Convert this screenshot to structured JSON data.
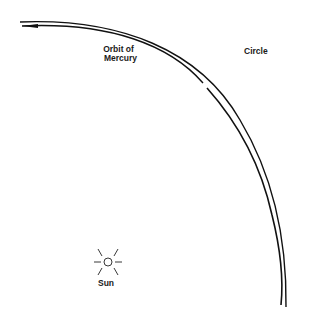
{
  "labels": {
    "orbit": [
      "Orbit of",
      "Mercury"
    ],
    "circle": "Circle",
    "sun": "Sun"
  },
  "colors": {
    "line": "#111111",
    "background": "#ffffff"
  }
}
